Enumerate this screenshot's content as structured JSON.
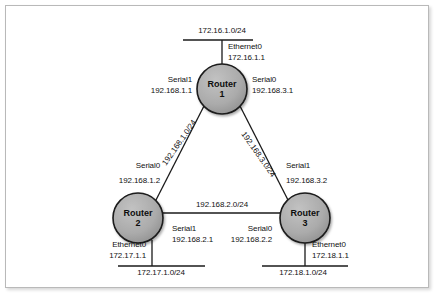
{
  "diagram": {
    "nodes": [
      {
        "id": "router1",
        "label_line1": "Router",
        "label_line2": "1",
        "cx": 222,
        "cy": 89,
        "r": 25
      },
      {
        "id": "router2",
        "label_line1": "Router",
        "label_line2": "2",
        "cx": 138,
        "cy": 218,
        "r": 25
      },
      {
        "id": "router3",
        "label_line1": "Router",
        "label_line2": "3",
        "cx": 305,
        "cy": 218,
        "r": 25
      }
    ],
    "networks": {
      "top": "172.16.1.0/24",
      "left_link": "192.168.1.0/24",
      "right_link": "192.168.3.0/24",
      "center_link": "192.168.2.0/24",
      "bottom_left": "172.17.1.0/24",
      "bottom_right": "172.18.1.0/24"
    },
    "interfaces": {
      "r1_ethernet0_name": "Ethernet0",
      "r1_ethernet0_addr": "172.16.1.1",
      "r1_serial1_name": "Serial1",
      "r1_serial1_addr": "192.168.1.1",
      "r1_serial0_name": "Serial0",
      "r1_serial0_addr": "192.168.3.1",
      "r2_serial0_name": "Serial0",
      "r2_serial0_addr": "192.168.1.2",
      "r2_serial1_name": "Serial1",
      "r2_serial1_addr": "192.168.2.1",
      "r2_ethernet0_name": "Ethernet0",
      "r2_ethernet0_addr": "172.17.1.1",
      "r3_serial1_name": "Serial1",
      "r3_serial1_addr": "192.168.3.2",
      "r3_serial0_name": "Serial0",
      "r3_serial0_addr": "192.168.2.2",
      "r3_ethernet0_name": "Ethernet0",
      "r3_ethernet0_addr": "172.18.1.1"
    },
    "colors": {
      "node_fill": "#a8a8a8",
      "node_stroke": "#1a1a1a",
      "line": "#1a1a1a",
      "frame": "#b9b9b9",
      "text": "#111111"
    }
  }
}
